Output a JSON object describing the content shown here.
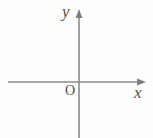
{
  "figure": {
    "kind": "cartesian-coordinate-axes",
    "width": 153,
    "height": 138,
    "background_color": "#fffefe"
  },
  "axes": {
    "line_color": "#8b8b8b",
    "line_width": 1.6,
    "origin": {
      "x": 79,
      "y": 82
    },
    "x_axis": {
      "label": "x",
      "start_x": 8,
      "end_x": 146,
      "y": 82,
      "arrow": "right"
    },
    "y_axis": {
      "label": "y",
      "x": 79,
      "start_y": 138,
      "end_y": 10,
      "arrow": "up"
    }
  },
  "labels": {
    "x_label": "x",
    "y_label": "y",
    "origin_label": "O",
    "text_color": "#4f4f4f"
  }
}
